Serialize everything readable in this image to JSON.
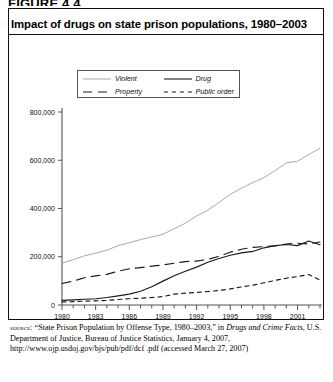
{
  "figure_label": "FIGURE 4.4",
  "title": "Impact of drugs on state prison populations, 1980–2003",
  "legend": [
    {
      "label": "Violent",
      "style": "solid",
      "color": "#aaaaaa",
      "name": "violent"
    },
    {
      "label": "Drug",
      "style": "solid",
      "color": "#1a1a1a",
      "name": "drug"
    },
    {
      "label": "Property",
      "style": "long-dash",
      "color": "#1a1a1a",
      "name": "property"
    },
    {
      "label": "Public order",
      "style": "short-dash",
      "color": "#1a1a1a",
      "name": "public-order"
    }
  ],
  "source": {
    "label": "source:",
    "line1": " “State Prison Population by Offense Type, 1980–2003,” in ",
    "italic": "Drugs and Crime Facts",
    "line2": ", U.S. Department of Justice, Bureau of Justice Statistics, January 4, 2007, http://www.ojp.usdoj.gov/bjs/pub/pdf/dcf .pdf (accessed March 27, 2007)"
  },
  "chart_data": {
    "type": "line",
    "title": "Impact of drugs on state prison populations, 1980–2003",
    "xlabel": "",
    "ylabel": "",
    "xlim": [
      1980,
      2003
    ],
    "ylim": [
      0,
      800000
    ],
    "yticks": [
      0,
      200000,
      400000,
      600000,
      800000
    ],
    "ytick_labels": [
      "0",
      "200,000",
      "400,000",
      "600,000",
      "800,000"
    ],
    "xticks": [
      1980,
      1983,
      1986,
      1989,
      1992,
      1995,
      1998,
      2001
    ],
    "xtick_labels": [
      "1980",
      "1983",
      "1986",
      "1989",
      "1992",
      "1995",
      "1998",
      "2001"
    ],
    "x_minor_every": 1,
    "grid": false,
    "legend_position": "top",
    "x": [
      1980,
      1981,
      1982,
      1983,
      1984,
      1985,
      1986,
      1987,
      1988,
      1989,
      1990,
      1991,
      1992,
      1993,
      1994,
      1995,
      1996,
      1997,
      1998,
      1999,
      2000,
      2001,
      2002,
      2003
    ],
    "series": [
      {
        "name": "Violent",
        "color": "#aaaaaa",
        "style": "solid",
        "values": [
          173300,
          188000,
          204000,
          215000,
          227000,
          246000,
          258000,
          271000,
          282000,
          293000,
          316000,
          339000,
          369000,
          393000,
          425000,
          459000,
          484000,
          507000,
          528000,
          557000,
          589000,
          596000,
          624000,
          650000
        ]
      },
      {
        "name": "Drug",
        "color": "#1a1a1a",
        "style": "solid",
        "values": [
          19000,
          21000,
          24000,
          26000,
          31000,
          38000,
          45000,
          57000,
          76000,
          99000,
          121000,
          140000,
          157000,
          177000,
          193000,
          206000,
          216000,
          222000,
          237000,
          246000,
          251000,
          246000,
          265000,
          250000
        ]
      },
      {
        "name": "Property",
        "color": "#1a1a1a",
        "style": "long-dash",
        "values": [
          89300,
          99000,
          113000,
          121000,
          127000,
          140000,
          150000,
          155000,
          161000,
          166000,
          173000,
          180000,
          182000,
          189000,
          202000,
          219000,
          231000,
          239000,
          242000,
          245000,
          253000,
          256000,
          253000,
          261000
        ]
      },
      {
        "name": "Public order",
        "color": "#1a1a1a",
        "style": "short-dash",
        "values": [
          12400,
          14000,
          16000,
          17000,
          19000,
          23000,
          26000,
          28000,
          31000,
          35000,
          45000,
          49000,
          52000,
          56000,
          60000,
          67000,
          75000,
          82000,
          92000,
          102000,
          111000,
          118000,
          126000,
          104000
        ]
      }
    ]
  }
}
